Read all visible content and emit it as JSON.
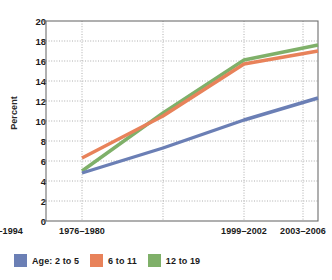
{
  "figure": {
    "clipped_header": "",
    "background": "#ffffff"
  },
  "chart_data": {
    "type": "line",
    "title": "",
    "xlabel": "",
    "ylabel": "Percent",
    "categories": [
      "1976–1980",
      "1988–1994",
      "1999–2002",
      "2003–2006"
    ],
    "ylim": [
      0,
      20
    ],
    "ytick_values": [
      0,
      2,
      4,
      6,
      8,
      10,
      12,
      14,
      16,
      18,
      20
    ],
    "ytick_labels": [
      "0",
      "2",
      "4",
      "6",
      "8",
      "10",
      "12",
      "14",
      "16",
      "18",
      "20"
    ],
    "grid": true,
    "grid_style": "dotted",
    "legend_position": "below",
    "series": [
      {
        "name": "Age: 2 to 5",
        "color": "#6b7fb5",
        "values": [
          4.8,
          7.3,
          10.1,
          12.3
        ]
      },
      {
        "name": "6 to 11",
        "color": "#e8825a",
        "values": [
          6.3,
          10.5,
          15.7,
          17.0
        ]
      },
      {
        "name": "12 to 19",
        "color": "#7fb069",
        "values": [
          5.0,
          10.8,
          16.1,
          17.6
        ]
      }
    ]
  },
  "axes": {
    "y_axis_label": "Percent",
    "ytick_0": "0",
    "ytick_2": "2",
    "ytick_4": "4",
    "ytick_6": "6",
    "ytick_8": "8",
    "ytick_10": "10",
    "ytick_12": "12",
    "ytick_14": "14",
    "ytick_16": "16",
    "ytick_18": "18",
    "ytick_20": "20",
    "xtick_0": "1976–1980",
    "xtick_1": "1988–1994",
    "xtick_2": "1999–2002",
    "xtick_3": "2003–2006"
  },
  "legend": {
    "items": [
      {
        "label": "Age: 2 to 5",
        "color": "#6b7fb5"
      },
      {
        "label": "6 to 11",
        "color": "#e8825a"
      },
      {
        "label": "12 to 19",
        "color": "#7fb069"
      }
    ]
  }
}
